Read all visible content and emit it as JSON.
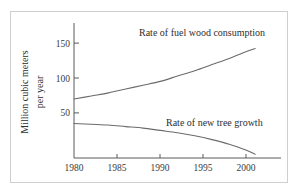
{
  "chart_data": {
    "type": "line",
    "title": "",
    "xlabel": "",
    "ylabel": "Million cubic meters\nper year",
    "ylabel_line1": "Million cubic meters",
    "ylabel_line2": "per year",
    "xlim": [
      1980,
      2004
    ],
    "ylim": [
      0,
      168
    ],
    "grid": false,
    "legend_position": "inline-annotation",
    "xticks": [
      1980,
      1985,
      1990,
      1995,
      2000
    ],
    "xtick_labels": [
      "1980",
      "1985",
      "1990",
      "1995",
      "2000"
    ],
    "yticks": [
      50,
      100,
      150
    ],
    "ytick_labels": [
      "50",
      "100",
      "150"
    ],
    "series": [
      {
        "name": "Rate of fuel wood consumption",
        "label": "Rate of fuel wood consumption",
        "color": "#6b6b6b",
        "x": [
          1980,
          1982,
          1984,
          1986,
          1988,
          1990,
          1992,
          1994,
          1996,
          1998,
          2000,
          2001
        ],
        "values": [
          77,
          81,
          85,
          90,
          95,
          100,
          107,
          114,
          122,
          130,
          139,
          143
        ]
      },
      {
        "name": "Rate of new tree growth",
        "label": "Rate of new tree growth",
        "color": "#6b6b6b",
        "x": [
          1980,
          1982,
          1984,
          1986,
          1988,
          1990,
          1992,
          1994,
          1996,
          1998,
          2000,
          2001
        ],
        "values": [
          45,
          44,
          43,
          41,
          39,
          36,
          33,
          29,
          24,
          18,
          10,
          5
        ]
      }
    ]
  },
  "annotations": {
    "upper_label": "Rate of fuel wood consumption",
    "lower_label": "Rate of new tree growth"
  },
  "colors": {
    "line": "#6b6b6b",
    "axis": "#5a5a5a",
    "text": "#2e2e2e",
    "frame": "#cfcfcf",
    "background": "#ffffff"
  }
}
